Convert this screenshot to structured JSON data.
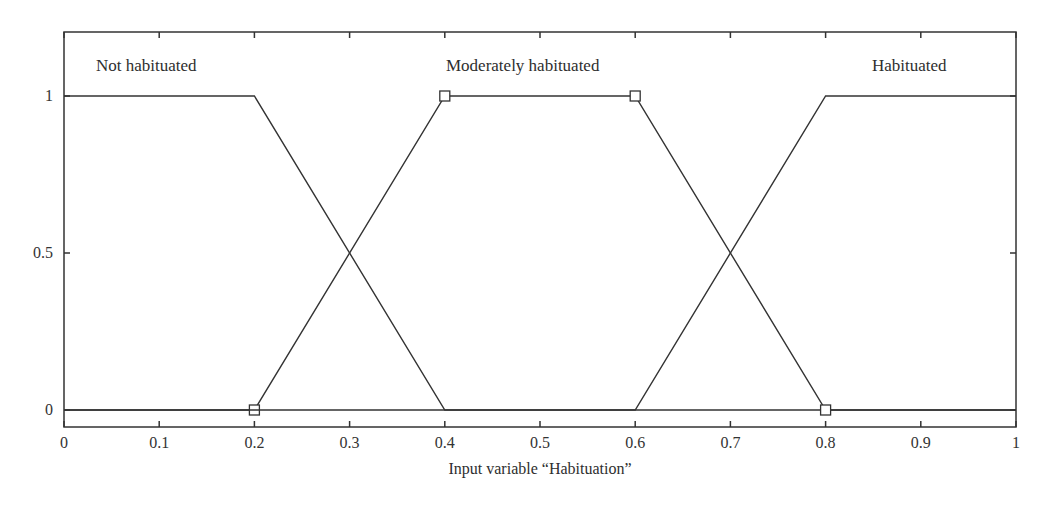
{
  "chart_data": {
    "type": "line",
    "title": "",
    "xlabel": "Input variable “Habituation”",
    "ylabel": "",
    "xlim": [
      0,
      1
    ],
    "ylim": [
      0,
      1
    ],
    "grid": false,
    "x_ticks": [
      "0",
      "0.1",
      "0.2",
      "0.3",
      "0.4",
      "0.5",
      "0.6",
      "0.7",
      "0.8",
      "0.9",
      "1"
    ],
    "y_ticks": [
      "0",
      "0.5",
      "1"
    ],
    "series": [
      {
        "name": "Not habituated",
        "x": [
          0,
          0.2,
          0.4,
          1
        ],
        "y": [
          1,
          1,
          0,
          0
        ]
      },
      {
        "name": "Moderately habituated",
        "x": [
          0,
          0.2,
          0.4,
          0.6,
          0.8,
          1
        ],
        "y": [
          0,
          0,
          1,
          1,
          0,
          0
        ],
        "markers": [
          [
            0.2,
            0
          ],
          [
            0.4,
            1
          ],
          [
            0.6,
            1
          ],
          [
            0.8,
            0
          ]
        ]
      },
      {
        "name": "Habituated",
        "x": [
          0,
          0.6,
          0.8,
          1
        ],
        "y": [
          0,
          0,
          1,
          1
        ]
      }
    ],
    "annotations": [
      "Not habituated",
      "Moderately habituated",
      "Habituated"
    ]
  },
  "labels": {
    "not_habituated": "Not habituated",
    "moderately_habituated": "Moderately habituated",
    "habituated": "Habituated",
    "xlabel": "Input variable “Habituation”"
  },
  "ticks": {
    "x": [
      "0",
      "0.1",
      "0.2",
      "0.3",
      "0.4",
      "0.5",
      "0.6",
      "0.7",
      "0.8",
      "0.9",
      "1"
    ],
    "y": [
      "0",
      "0.5",
      "1"
    ]
  }
}
